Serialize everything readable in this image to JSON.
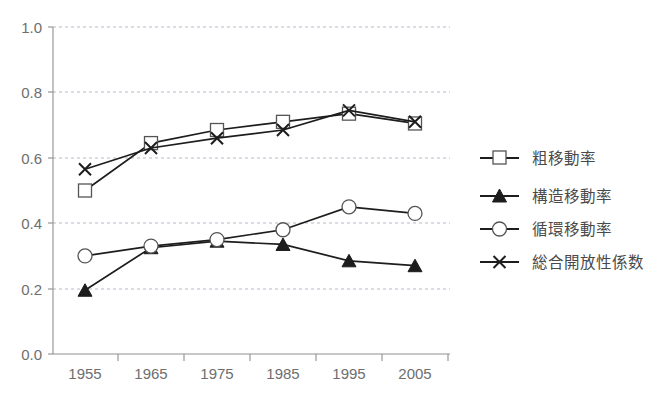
{
  "chart_data": {
    "type": "line",
    "title": "",
    "subtitle": "",
    "xlabel": "",
    "ylabel": "",
    "x": [
      1955,
      1965,
      1975,
      1985,
      1995,
      2005
    ],
    "categories": [
      "1955",
      "1965",
      "1975",
      "1985",
      "1995",
      "2005"
    ],
    "xtick_labels": [
      "1955",
      "1965",
      "1975",
      "1985",
      "1995",
      "2005"
    ],
    "ytick_labels": [
      "0.0",
      "0.2",
      "0.4",
      "0.6",
      "0.8",
      "1.0"
    ],
    "ytick_values": [
      0.0,
      0.2,
      0.4,
      0.6,
      0.8,
      1.0
    ],
    "ylim": [
      0.0,
      1.0
    ],
    "grid": "horizontal-dashed",
    "legend_position": "right",
    "series": [
      {
        "name": "粗移動率",
        "marker": "open-square",
        "values": [
          0.5,
          0.645,
          0.685,
          0.71,
          0.735,
          0.705
        ]
      },
      {
        "name": "構造移動率",
        "marker": "filled-triangle",
        "values": [
          0.195,
          0.325,
          0.345,
          0.335,
          0.285,
          0.27
        ]
      },
      {
        "name": "循環移動率",
        "marker": "open-circle",
        "values": [
          0.3,
          0.33,
          0.35,
          0.38,
          0.45,
          0.43
        ]
      },
      {
        "name": "総合開放性係数",
        "marker": "cross-x",
        "values": [
          0.565,
          0.63,
          0.66,
          0.685,
          0.745,
          0.71
        ]
      }
    ]
  },
  "legend": {
    "entries": [
      {
        "label": "粗移動率",
        "marker": "open-square"
      },
      {
        "label": "構造移動率",
        "marker": "filled-triangle"
      },
      {
        "label": "循環移動率",
        "marker": "open-circle"
      },
      {
        "label": "総合開放性係数",
        "marker": "cross-x"
      }
    ]
  },
  "colors": {
    "line": "#1d1d1d",
    "grid": "#b9b9c9",
    "axis": "#8f8f8f",
    "tick_text": "#6e6e6e",
    "legend_text": "#4a4a4a",
    "background": "#ffffff"
  }
}
